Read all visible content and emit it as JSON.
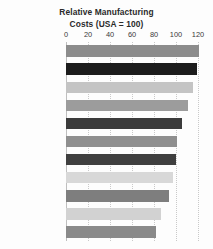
{
  "chart_data": {
    "type": "bar",
    "orientation": "horizontal",
    "title": "Relative Manufacturing Costs (USA = 100)",
    "title_lines": [
      "Relative Manufacturing",
      "Costs (USA = 100)"
    ],
    "xlabel": "",
    "ylabel": "",
    "xlim": [
      0,
      125
    ],
    "xticks": [
      0,
      20,
      40,
      60,
      80,
      100,
      120
    ],
    "xtick_labels": [
      "0",
      "20",
      "40",
      "60",
      "80",
      "100",
      "120"
    ],
    "grid": true,
    "grid_axis": "x",
    "legend": false,
    "categories": [
      "Switzerland",
      "Germany",
      "Finland",
      "Australia",
      "Japan",
      "South Korea",
      "United States",
      "Poland",
      "China",
      "Mexico",
      "Indonesia"
    ],
    "values": [
      121,
      119,
      115,
      111,
      105,
      101,
      100,
      97,
      94,
      86,
      82
    ],
    "bar_colors": [
      "#8c8c8c",
      "#1c1c1c",
      "#c4c4c4",
      "#9c9c9c",
      "#3b3b3b",
      "#8f8f8f",
      "#3f3f3f",
      "#d8d8d8",
      "#7e7e7e",
      "#d2d2d2",
      "#8a8a8a"
    ]
  },
  "style": {
    "background": "#fdfdfd",
    "title_color": "#2a2a2a",
    "label_color": "#4d4d4d",
    "tick_color": "#3a3a3a",
    "grid_color": "#c9c9c9",
    "axis_color": "#bfbfbf"
  }
}
